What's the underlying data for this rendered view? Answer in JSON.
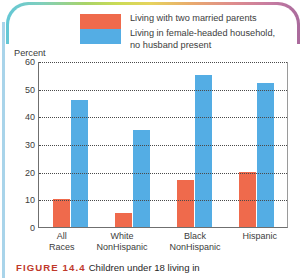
{
  "figure": {
    "number_label": "FIGURE 14.4",
    "caption_text": "Children under 18 living in",
    "number_color": "#c0392b"
  },
  "legend": {
    "items": [
      {
        "swatch": "red-swatch",
        "color": "#ef6a4c",
        "label": "Living with two married parents"
      },
      {
        "swatch": "blue-swatch",
        "color": "#54ade4",
        "label_line1": "Living in female-headed household,",
        "label_line2": "no husband present"
      }
    ]
  },
  "chart_data": {
    "type": "bar",
    "title": "",
    "subtitle": "",
    "xlabel": "",
    "ylabel": "Percent",
    "ylim": [
      0,
      60
    ],
    "yticks": [
      0,
      10,
      20,
      30,
      40,
      50,
      60
    ],
    "ytick_labels": [
      "0",
      "10",
      "20",
      "30",
      "40",
      "50",
      "60"
    ],
    "grid": true,
    "grid_style": "dotted-horizontal",
    "legend_position": "top",
    "categories": [
      "All Races",
      "White NonHispanic",
      "Black NonHispanic",
      "Hispanic"
    ],
    "category_lines": [
      {
        "line1": "All",
        "line2": "Races"
      },
      {
        "line1": "White",
        "line2": "NonHispanic"
      },
      {
        "line1": "Black",
        "line2": "NonHispanic"
      },
      {
        "line1": "Hispanic",
        "line2": ""
      }
    ],
    "series": [
      {
        "name": "Living with two married parents",
        "color": "#ef6a4c",
        "values": [
          10,
          5,
          17,
          20
        ]
      },
      {
        "name": "Living in female-headed household, no husband present",
        "color": "#54ade4",
        "values": [
          46,
          35,
          55,
          52
        ]
      }
    ]
  },
  "decor": {
    "left_edge_color": "#a9d4ea",
    "arc_gradient": "teal-green-yellow-orange-pink"
  }
}
